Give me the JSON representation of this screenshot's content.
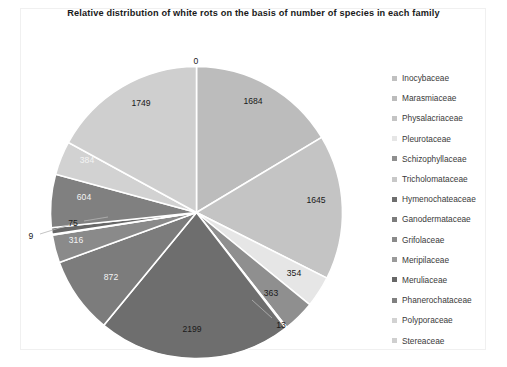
{
  "chart": {
    "title": "Relative distribution of white rots on the basis of number of species in each family"
  },
  "legend": {
    "position": "right",
    "items": [
      {
        "label": "Inocybaceae",
        "color": "#c0c0c0"
      },
      {
        "label": "Marasmiaceae",
        "color": "#bcbcbc"
      },
      {
        "label": "Physalacriaceae",
        "color": "#c4c4c4"
      },
      {
        "label": "Pleurotaceae",
        "color": "#e6e6e6"
      },
      {
        "label": "Schizophyllaceae",
        "color": "#8f8f8f"
      },
      {
        "label": "Tricholomataceae",
        "color": "#c8c8c8"
      },
      {
        "label": "Hymenochateaceae",
        "color": "#6e6e6e"
      },
      {
        "label": "Ganodermataceae",
        "color": "#7c7c7c"
      },
      {
        "label": "Grifolaceae",
        "color": "#8a8a8a"
      },
      {
        "label": "Meripilaceae",
        "color": "#9a9a9a"
      },
      {
        "label": "Meruliaceae",
        "color": "#676767"
      },
      {
        "label": "Phanerochataceae",
        "color": "#808080"
      },
      {
        "label": "Polyporaceae",
        "color": "#d2d2d2"
      },
      {
        "label": "Stereaceae",
        "color": "#cfcfcf"
      }
    ]
  },
  "chart_data": {
    "type": "pie",
    "title": "Relative distribution of white rots on the basis of number of species in each family",
    "xlabel": "",
    "ylabel": "",
    "total": 10267,
    "start_angle_deg": 0,
    "direction": "clockwise",
    "grid": false,
    "legend_position": "right",
    "categories": [
      "Inocybaceae",
      "Marasmiaceae",
      "Physalacriaceae",
      "Pleurotaceae",
      "Schizophyllaceae",
      "Tricholomataceae",
      "Hymenochateaceae",
      "Ganodermataceae",
      "Grifolaceae",
      "Meripilaceae",
      "Meruliaceae",
      "Phanerochataceae",
      "Polyporaceae",
      "Stereaceae"
    ],
    "values": [
      0,
      1684,
      1645,
      354,
      363,
      13,
      2199,
      872,
      316,
      9,
      75,
      604,
      384,
      1749
    ],
    "labels": [
      "0",
      "1684",
      "1645",
      "354",
      "363",
      "13",
      "2199",
      "872",
      "316",
      "9",
      "75",
      "604",
      "384",
      "1749"
    ],
    "colors": [
      "#c0c0c0",
      "#bcbcbc",
      "#c4c4c4",
      "#e6e6e6",
      "#8f8f8f",
      "#c8c8c8",
      "#6e6e6e",
      "#7c7c7c",
      "#8a8a8a",
      "#9a9a9a",
      "#676767",
      "#808080",
      "#d2d2d2",
      "#cfcfcf"
    ],
    "slices": [
      {
        "category": "Inocybaceae",
        "value": 0,
        "label": "0",
        "color": "#c0c0c0",
        "label_placement": "outside"
      },
      {
        "category": "Marasmiaceae",
        "value": 1684,
        "label": "1684",
        "color": "#bcbcbc",
        "label_placement": "inside"
      },
      {
        "category": "Physalacriaceae",
        "value": 1645,
        "label": "1645",
        "color": "#c4c4c4",
        "label_placement": "inside"
      },
      {
        "category": "Pleurotaceae",
        "value": 354,
        "label": "354",
        "color": "#e6e6e6",
        "label_placement": "inside"
      },
      {
        "category": "Schizophyllaceae",
        "value": 363,
        "label": "363",
        "color": "#8f8f8f",
        "label_placement": "inside"
      },
      {
        "category": "Tricholomataceae",
        "value": 13,
        "label": "13",
        "color": "#c8c8c8",
        "label_placement": "outside"
      },
      {
        "category": "Hymenochateaceae",
        "value": 2199,
        "label": "2199",
        "color": "#6e6e6e",
        "label_placement": "inside"
      },
      {
        "category": "Ganodermataceae",
        "value": 872,
        "label": "872",
        "color": "#7c7c7c",
        "label_placement": "inside"
      },
      {
        "category": "Grifolaceae",
        "value": 316,
        "label": "316",
        "color": "#8a8a8a",
        "label_placement": "inside"
      },
      {
        "category": "Meripilaceae",
        "value": 9,
        "label": "9",
        "color": "#9a9a9a",
        "label_placement": "outside"
      },
      {
        "category": "Meruliaceae",
        "value": 75,
        "label": "75",
        "color": "#676767",
        "label_placement": "outside"
      },
      {
        "category": "Phanerochataceae",
        "value": 604,
        "label": "604",
        "color": "#808080",
        "label_placement": "inside"
      },
      {
        "category": "Polyporaceae",
        "value": 384,
        "label": "384",
        "color": "#d2d2d2",
        "label_placement": "inside"
      },
      {
        "category": "Stereaceae",
        "value": 1749,
        "label": "1749",
        "color": "#cfcfcf",
        "label_placement": "inside"
      }
    ]
  }
}
